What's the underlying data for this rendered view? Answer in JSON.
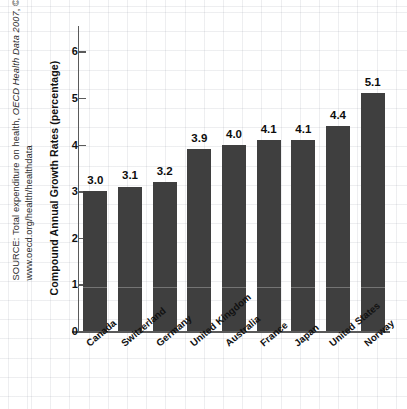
{
  "source_note": {
    "prefix": "SOURCE: Total expenditure on health, ",
    "italic": "OECD Health Data 2007",
    "suffix": ", © OECD 2007.",
    "url": "www.oecd.org/health/healthdata",
    "full": "SOURCE: Total expenditure on health, OECD Health Data 2007, © OECD 2007. www.oecd.org/health/healthdata"
  },
  "colors": {
    "bar": "#3f3f3f",
    "axis": "#5a5a5a",
    "text": "#111111",
    "grid": "#787d8c"
  },
  "chart_data": {
    "type": "bar",
    "title": "",
    "xlabel": "",
    "ylabel": "Compound Annual Growth Rates (percentage)",
    "ylim": [
      0,
      6.5
    ],
    "yticks": [
      0,
      1,
      2,
      3,
      4,
      5,
      6
    ],
    "ytick_labels": [
      "0",
      "1",
      "2",
      "3",
      "4",
      "5",
      "6"
    ],
    "grid": true,
    "legend": "none",
    "categories": [
      "Canada",
      "Switzerland",
      "Germany",
      "United Kingdom",
      "Australia",
      "France",
      "Japan",
      "United States",
      "Norway"
    ],
    "values": [
      3.0,
      3.1,
      3.2,
      3.9,
      4.0,
      4.1,
      4.1,
      4.4,
      5.1
    ],
    "data_labels": [
      "3.0",
      "3.1",
      "3.2",
      "3.9",
      "4.0",
      "4.1",
      "4.1",
      "4.4",
      "5.1"
    ]
  }
}
